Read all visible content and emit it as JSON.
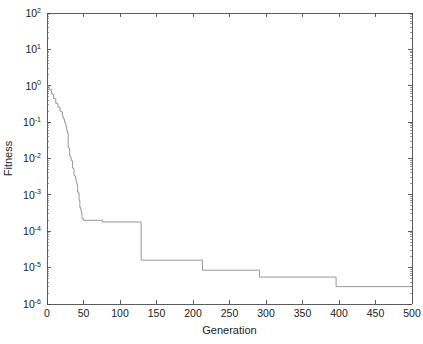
{
  "figure": {
    "background_color": "#ffffff",
    "line_color": "#8c8c8c",
    "axis_color": "#4a4a4a",
    "text_color": "#1a1a1a"
  },
  "chart_data": {
    "type": "line",
    "title": "",
    "xlabel": "Generation",
    "ylabel": "Fitness",
    "xlim": [
      0,
      500
    ],
    "ylim": [
      1e-06,
      100
    ],
    "yscale": "log",
    "xscale": "linear",
    "grid": false,
    "legend": "none",
    "xticks": [
      0,
      50,
      100,
      150,
      200,
      250,
      300,
      350,
      400,
      450,
      500
    ],
    "xtick_labels": [
      "0",
      "50",
      "100",
      "150",
      "200",
      "250",
      "300",
      "350",
      "400",
      "450",
      "500"
    ],
    "yticks": [
      1e-06,
      1e-05,
      0.0001,
      0.001,
      0.01,
      0.1,
      1,
      10,
      100
    ],
    "ytick_labels": [
      {
        "mantissa": "10",
        "exponent": "-6"
      },
      {
        "mantissa": "10",
        "exponent": "-5"
      },
      {
        "mantissa": "10",
        "exponent": "-4"
      },
      {
        "mantissa": "10",
        "exponent": "-3"
      },
      {
        "mantissa": "10",
        "exponent": "-2"
      },
      {
        "mantissa": "10",
        "exponent": "-1"
      },
      {
        "mantissa": "10",
        "exponent": "0"
      },
      {
        "mantissa": "10",
        "exponent": "1"
      },
      {
        "mantissa": "10",
        "exponent": "2"
      }
    ],
    "series": [
      {
        "name": "best fitness",
        "x": [
          0,
          2,
          3,
          5,
          6,
          8,
          9,
          11,
          12,
          14,
          15,
          17,
          18,
          20,
          21,
          22,
          23,
          24,
          25,
          26,
          27,
          28,
          29,
          30,
          31,
          32,
          33,
          34,
          35,
          36,
          37,
          38,
          39,
          40,
          41,
          42,
          43,
          44,
          45,
          46,
          47,
          48,
          50,
          75,
          76,
          128,
          129,
          212,
          213,
          290,
          291,
          395,
          396,
          500
        ],
        "y": [
          1.0,
          0.95,
          0.8,
          0.78,
          0.6,
          0.58,
          0.45,
          0.43,
          0.33,
          0.32,
          0.26,
          0.25,
          0.2,
          0.19,
          0.15,
          0.13,
          0.12,
          0.1,
          0.09,
          0.075,
          0.06,
          0.05,
          0.02,
          0.019,
          0.012,
          0.011,
          0.009,
          0.0085,
          0.0055,
          0.0052,
          0.0035,
          0.0033,
          0.0028,
          0.0022,
          0.0019,
          0.0012,
          0.0011,
          0.0007,
          0.00045,
          0.0004,
          0.00032,
          0.00022,
          0.0002,
          0.0002,
          0.00018,
          0.00018,
          1.6e-05,
          1.6e-05,
          8.5e-06,
          8.5e-06,
          5.5e-06,
          5.5e-06,
          3e-06,
          3e-06
        ]
      }
    ],
    "annotations": []
  }
}
